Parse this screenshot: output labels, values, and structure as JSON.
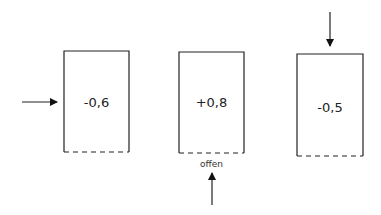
{
  "diagram": {
    "type": "pressure-coefficient-boxes",
    "boxes": [
      {
        "id": "box-1",
        "value": "-0,6",
        "open_side_label": "",
        "arrow": "left-side-pointing-right"
      },
      {
        "id": "box-2",
        "value": "+0,8",
        "open_side_label": "offen",
        "arrow": "below-pointing-up"
      },
      {
        "id": "box-3",
        "value": "-0,5",
        "open_side_label": "",
        "arrow": "above-pointing-down"
      }
    ],
    "bottom_edge_style": "dashed",
    "colors": {
      "stroke": "#222222",
      "background": "#ffffff"
    }
  }
}
